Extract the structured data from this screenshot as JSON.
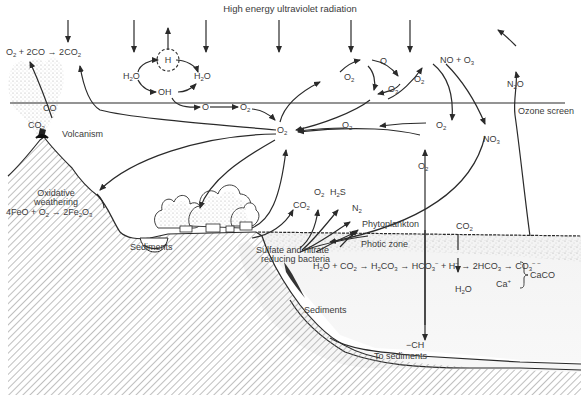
{
  "diagram": {
    "title": "High energy ultraviolet radiation",
    "layers": {
      "ozone_screen": "Ozone screen",
      "photic_zone": "Photic zone"
    },
    "atmosphere_labels": {
      "co_oxidation": [
        "O",
        "2",
        " + 2CO → 2CO",
        "2"
      ],
      "hydrogen": "H",
      "water_left": [
        "H",
        "2",
        "O"
      ],
      "water_right": [
        "H",
        "2",
        "O"
      ],
      "hydroxyl": "OH",
      "atomic_oxygen_low": "O",
      "oxygen_low": [
        "O",
        "2"
      ],
      "oxygen_upper_left": [
        "O",
        "2"
      ],
      "atomic_oxygen_upper": "O",
      "oxygen_upper_right": [
        "O",
        "2"
      ],
      "ozone_upper": [
        "O",
        "3"
      ],
      "no_ozone": [
        "NO + O",
        "3"
      ],
      "nitrous_oxide": [
        "N",
        "2",
        "O"
      ],
      "oxygen_hub": [
        "O",
        "2"
      ],
      "oxygen_mid": [
        "O",
        "2"
      ],
      "oxygen_right": [
        "O",
        "2"
      ],
      "nitrate": [
        "NO",
        "3"
      ],
      "oxygen_ocean": [
        "O",
        "2"
      ]
    },
    "land_labels": {
      "volcanism": "Volcanism",
      "co": "CO",
      "co2_volcano": [
        "CO",
        "2"
      ],
      "weathering_line1": "Oxidative",
      "weathering_line2": "weathering",
      "weathering_eq": [
        "4FeO + O",
        "2",
        " → 2Fe",
        "2",
        "O",
        "3"
      ],
      "sediments_basin": "Sediments",
      "co2_land": [
        "CO",
        "2"
      ],
      "o2_land": [
        "O",
        "2"
      ],
      "h2s_land": [
        "H",
        "2",
        "S"
      ],
      "n2_land": [
        "N",
        "2"
      ]
    },
    "ocean_labels": {
      "phytoplankton": "Phytoplankton",
      "bacteria_line1": "Sulfate and nitrate",
      "bacteria_line2": "reducing bacteria",
      "carbonate_eq": [
        "H",
        "2",
        "O + CO",
        "2",
        " → H",
        "2",
        "CO",
        "3",
        " → HCO",
        "3",
        "−",
        " + H",
        "−",
        " → 2HCO",
        "3",
        " → CO",
        "3",
        "− −"
      ],
      "co2_ocean": [
        "CO",
        "2"
      ],
      "h2o_ocean": [
        "H",
        "2",
        "O"
      ],
      "calcium": [
        "Ca",
        "+"
      ],
      "calcium_carbonate": "CaCO",
      "sediments_slope": "Sediments",
      "organic_carbon": "−CH",
      "to_sediments": "To sediments"
    },
    "colors": {
      "ink": "#2a2a2a",
      "text": "#3a3a3a",
      "hatch": "#8a8a8a",
      "water": "#f0f0f0",
      "stipple": "#9a9a9a"
    }
  }
}
